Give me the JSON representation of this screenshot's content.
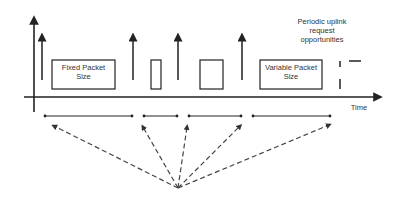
{
  "diagram": {
    "boxes": [
      {
        "id": "fixed",
        "label_line1": "Fixed Packet",
        "label_line2": "Size"
      },
      {
        "id": "small",
        "label_line1": "",
        "label_line2": ""
      },
      {
        "id": "medium",
        "label_line1": "",
        "label_line2": ""
      },
      {
        "id": "variable",
        "label_line1": "Variable  Packet",
        "label_line2": "Size"
      }
    ],
    "annotation": {
      "line1": "Periodic uplink",
      "line2": "request",
      "line3": "opportunities"
    },
    "axis_label": "Time",
    "colors": {
      "stroke": "#222222",
      "dashed": "#444444",
      "text": "#333333"
    }
  }
}
